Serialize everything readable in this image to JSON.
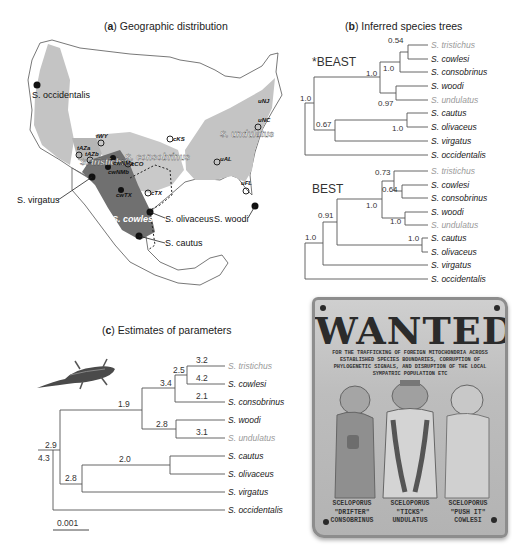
{
  "panel_a": {
    "title_letter": "a",
    "title_text": "Geographic distribution",
    "range_labels": {
      "tristichus": "S. tristichus",
      "consobrinus": "S. consobrinus",
      "undulatus": "S. undulatus",
      "cowlesi": "S. cowlesi"
    },
    "species_callouts": {
      "occidentalis": "S. occidentalis",
      "virgatus": "S. virgatus",
      "olivaceus": "S. olivaceus",
      "woodi": "S. woodi",
      "cautus": "S. cautus"
    },
    "sample_sites": [
      "tWY",
      "cCO",
      "cKS",
      "tAZa",
      "tAZb",
      "cwNMa",
      "cwNMb",
      "cwTX",
      "cTX",
      "uAL",
      "uNC",
      "uNJ",
      "uFL"
    ],
    "colors": {
      "light_range": "#c4c4c4",
      "dark_range": "#707070",
      "land": "#ffffff",
      "border": "#555555"
    }
  },
  "panel_b": {
    "title_letter": "b",
    "title_text": "Inferred species trees",
    "beast": {
      "label": "*BEAST",
      "tips": [
        "S. tristichus",
        "S. cowlesi",
        "S. consobrinus",
        "S. woodi",
        "S. undulatus",
        "S. cautus",
        "S. olivaceus",
        "S. virgatus",
        "S. occidentalis"
      ],
      "support": {
        "root": "1.0",
        "tri_cow": "0.54",
        "tri_cow_con": "1.0",
        "big_clade": "1.0",
        "woo_und": "0.97",
        "caut_oliv": "1.0",
        "caut_oliv_virg": "0.67"
      }
    },
    "best": {
      "label": "BEST",
      "tips": [
        "S. tristichus",
        "S. cowlesi",
        "S. consobrinus",
        "S. woodi",
        "S. undulatus",
        "S. cautus",
        "S. olivaceus",
        "S. virgatus",
        "S. occidentalis"
      ],
      "support": {
        "root": "1.0",
        "no_virg": "0.91",
        "tri_cow_con": "0.73",
        "cow_con": "0.64",
        "big_clade": "1.0",
        "woo_und": "1.0",
        "caut_oliv": "1.0"
      }
    }
  },
  "panel_c": {
    "title_letter": "c",
    "title_text": "Estimates of parameters",
    "tips": [
      "S. tristichus",
      "S. cowlesi",
      "S. consobrinus",
      "S. woodi",
      "S. undulatus",
      "S. cautus",
      "S. olivaceus",
      "S. virgatus",
      "S. occidentalis"
    ],
    "branch_values": {
      "tristichus": "3.2",
      "cowlesi": "4.2",
      "tri_cow": "2.5",
      "consobrinus": "2.1",
      "tri_cow_con": "3.4",
      "woo_und": "2.8",
      "undulatus": "3.1",
      "big_clade": "1.9",
      "caut_oliv": "2.0",
      "caut_oliv_virg": "2.8",
      "ingroup": "2.9",
      "root": "4.3"
    },
    "scale_bar": "0.001"
  },
  "poster": {
    "title": "WANTED",
    "subtitle": "FOR THE TRAFFICKING OF FOREIGN MITOCHONDRIA ACROSS ESTABLISHED SPECIES BOUNDARIES, CORRUPTION OF PHYLOGENETIC SIGNALS, AND DISRUPTION OF THE LOCAL SYMPATRIC POPULATION ETC",
    "suspects": [
      {
        "genus": "SCELOPORUS",
        "nickname": "\"DRIFTER\"",
        "species": "CONSOBRINUS"
      },
      {
        "genus": "SCELOPORUS",
        "nickname": "\"TICKS\"",
        "species": "UNDULATUS"
      },
      {
        "genus": "SCELOPORUS",
        "nickname": "\"PUSH IT\"",
        "species": "COWLESI"
      }
    ]
  },
  "colors": {
    "mito_grey_tip": "#9a9a9a",
    "tip_black": "#1a1a1a",
    "line": "#555555"
  }
}
